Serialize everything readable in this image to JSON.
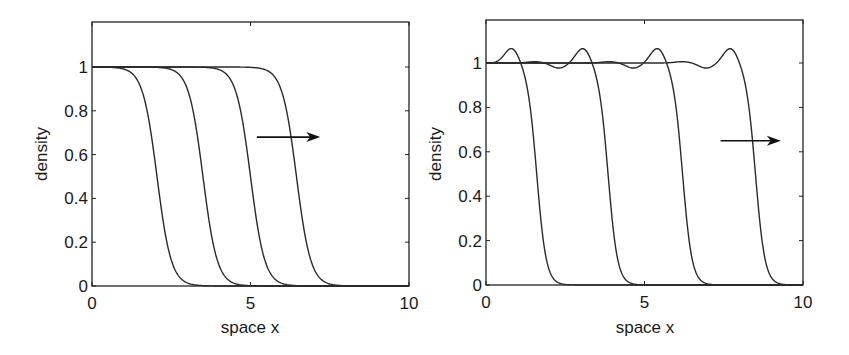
{
  "chart_data": [
    {
      "type": "line",
      "title": "",
      "xlabel": "space x",
      "ylabel": "density",
      "xlim": [
        0,
        10
      ],
      "ylim": [
        0,
        1.2
      ],
      "xticks": [
        0,
        5,
        10
      ],
      "xtick_labels": [
        "0",
        "5",
        "10"
      ],
      "yticks": [
        0,
        0.2,
        0.4,
        0.6,
        0.8,
        1
      ],
      "ytick_labels": [
        "0",
        "0.2",
        "0.4",
        "0.6",
        "0.8",
        "1"
      ],
      "grid": false,
      "legend": null,
      "annotation": "arrow pointing right (direction of front propagation)",
      "arrow": {
        "x0": 5.2,
        "x1": 7.2,
        "y": 0.68
      },
      "front_model": {
        "kind": "smooth_tanh",
        "width": 0.45,
        "overshoot": 0
      },
      "series": [
        {
          "name": "t1",
          "midpoint": 2.05,
          "x": [
            0,
            1,
            1.5,
            2.05,
            2.5,
            3,
            4
          ],
          "y": [
            1.0,
            0.99,
            0.92,
            0.5,
            0.12,
            0.01,
            0.0
          ]
        },
        {
          "name": "t2",
          "midpoint": 3.5,
          "x": [
            0,
            2,
            3,
            3.5,
            4,
            4.5,
            5.5
          ],
          "y": [
            1.0,
            0.99,
            0.9,
            0.5,
            0.1,
            0.01,
            0.0
          ]
        },
        {
          "name": "t3",
          "midpoint": 5.0,
          "x": [
            0,
            3.5,
            4.5,
            5.0,
            5.5,
            6,
            7
          ],
          "y": [
            1.0,
            0.99,
            0.9,
            0.5,
            0.1,
            0.01,
            0.0
          ]
        },
        {
          "name": "t4",
          "midpoint": 6.45,
          "x": [
            0,
            5,
            6,
            6.45,
            7,
            7.5,
            8.5
          ],
          "y": [
            1.0,
            0.99,
            0.88,
            0.5,
            0.1,
            0.01,
            0.0
          ]
        }
      ]
    },
    {
      "type": "line",
      "title": "",
      "xlabel": "space x",
      "ylabel": "density",
      "xlim": [
        0,
        10
      ],
      "ylim": [
        0,
        1.2
      ],
      "xticks": [
        0,
        5,
        10
      ],
      "xtick_labels": [
        "0",
        "5",
        "10"
      ],
      "yticks": [
        0,
        0.2,
        0.4,
        0.6,
        0.8,
        1
      ],
      "ytick_labels": [
        "0",
        "0.2",
        "0.4",
        "0.6",
        "0.8",
        "1"
      ],
      "grid": false,
      "legend": null,
      "annotation": "arrow pointing right (direction of front propagation)",
      "arrow": {
        "x0": 7.4,
        "x1": 9.3,
        "y": 0.65
      },
      "front_model": {
        "kind": "sharp_with_overshoot",
        "width": 0.3,
        "peak_value": 1.07,
        "dip_value": 0.977
      },
      "series": [
        {
          "name": "t1",
          "midpoint": 1.6,
          "x": [
            0,
            0.85,
            1.2,
            1.6,
            2.0,
            2.5
          ],
          "y": [
            1.0,
            1.07,
            0.95,
            0.5,
            0.08,
            0.0
          ]
        },
        {
          "name": "t2",
          "midpoint": 3.85,
          "x": [
            0,
            0.9,
            2.3,
            3.0,
            3.45,
            3.85,
            4.25,
            4.8
          ],
          "y": [
            1.0,
            1.005,
            0.977,
            1.07,
            0.95,
            0.5,
            0.08,
            0.0
          ]
        },
        {
          "name": "t3",
          "midpoint": 6.2,
          "x": [
            0,
            3.2,
            4.5,
            5.3,
            5.8,
            6.2,
            6.6,
            7.2
          ],
          "y": [
            1.0,
            1.005,
            0.977,
            1.07,
            0.95,
            0.5,
            0.08,
            0.0
          ]
        },
        {
          "name": "t4",
          "midpoint": 8.5,
          "x": [
            0,
            6.2,
            6.85,
            7.6,
            8.1,
            8.5,
            8.9,
            9.6
          ],
          "y": [
            1.0,
            1.01,
            0.977,
            1.08,
            0.95,
            0.5,
            0.08,
            0.0
          ]
        }
      ]
    }
  ],
  "panels": [
    {
      "xlabel": "space x",
      "ylabel": "density"
    },
    {
      "xlabel": "space x",
      "ylabel": "density"
    }
  ],
  "colors": {
    "line": "#2a2a2a",
    "axis": "#222222",
    "background": "#ffffff"
  }
}
